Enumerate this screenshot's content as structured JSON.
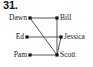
{
  "figure": {
    "problem_number": "31.",
    "type": "graph-diagram",
    "width": 93,
    "height": 67,
    "edge_color": "#555555",
    "node_color": "#111111",
    "background_color": "#ffffff"
  },
  "graph": {
    "nodes": [
      {
        "id": "dawn",
        "label": "Dawn",
        "side": "left",
        "x": 30,
        "y": 18
      },
      {
        "id": "bill",
        "label": "Bill",
        "side": "right",
        "x": 57,
        "y": 18
      },
      {
        "id": "ed",
        "label": "Ed",
        "side": "left",
        "x": 27,
        "y": 37
      },
      {
        "id": "jessica",
        "label": "Jessica",
        "side": "right",
        "x": 61,
        "y": 37
      },
      {
        "id": "pam",
        "label": "Pam",
        "side": "left",
        "x": 30,
        "y": 55
      },
      {
        "id": "scott",
        "label": "Scott",
        "side": "right",
        "x": 57,
        "y": 55
      }
    ],
    "edges": [
      {
        "id": "dawn-bill",
        "from": "dawn",
        "to": "bill"
      },
      {
        "id": "dawn-scott",
        "from": "dawn",
        "to": "scott"
      },
      {
        "id": "bill-scott",
        "from": "bill",
        "to": "scott"
      },
      {
        "id": "ed-jessica",
        "from": "ed",
        "to": "jessica"
      },
      {
        "id": "pam-scott",
        "from": "pam",
        "to": "scott"
      },
      {
        "id": "jessica-scott",
        "from": "jessica",
        "to": "scott"
      }
    ]
  }
}
